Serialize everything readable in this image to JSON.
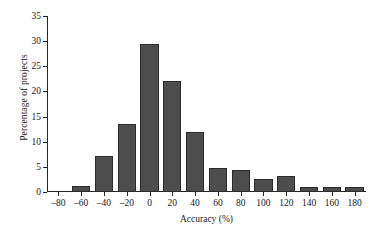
{
  "chart_data": {
    "type": "bar",
    "title": "",
    "xlabel": "Accuracy (%)",
    "ylabel": "Percentage of projects",
    "categories": [
      -80,
      -60,
      -40,
      -20,
      0,
      20,
      40,
      60,
      80,
      100,
      120,
      140,
      160,
      180
    ],
    "category_labels": [
      "–80",
      "–60",
      "–40",
      "–20",
      "0",
      "20",
      "40",
      "60",
      "80",
      "100",
      "120",
      "140",
      "160",
      "180"
    ],
    "values": [
      0,
      1.2,
      7.2,
      13.6,
      29.5,
      22.1,
      12.0,
      4.8,
      4.4,
      2.6,
      3.1,
      0.9,
      0.9,
      0.9
    ],
    "xlim": [
      -90,
      190
    ],
    "ylim": [
      0,
      35
    ],
    "y_ticks": [
      0,
      5,
      10,
      15,
      20,
      25,
      30,
      35
    ],
    "y_tick_labels": [
      "0",
      "5",
      "10",
      "15",
      "20",
      "25",
      "30",
      "35"
    ],
    "grid": false,
    "legend": null,
    "bar_color": "#4d4d4d",
    "bar_edge_color": "#2b2b2b",
    "axis_color": "#262626"
  }
}
